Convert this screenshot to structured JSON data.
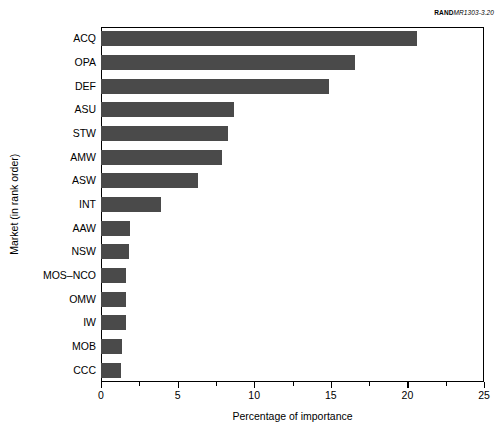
{
  "source_tag": {
    "brand": "RAND",
    "code": "MR1303-3.20"
  },
  "chart_data": {
    "type": "bar",
    "orientation": "horizontal",
    "title": "",
    "xlabel": "Percentage of importance",
    "ylabel": "Market (in rank order)",
    "categories": [
      "ACQ",
      "OPA",
      "DEF",
      "ASU",
      "STW",
      "AMW",
      "ASW",
      "INT",
      "AAW",
      "NSW",
      "MOS–NCO",
      "OMW",
      "IW",
      "MOB",
      "CCC"
    ],
    "values": [
      20.6,
      16.6,
      14.9,
      8.7,
      8.3,
      7.9,
      6.3,
      3.9,
      1.9,
      1.8,
      1.6,
      1.6,
      1.6,
      1.4,
      1.3
    ],
    "xlim": [
      0,
      25
    ],
    "xticks": [
      0,
      5,
      10,
      15,
      20,
      25
    ],
    "xticklabels": [
      "0",
      "5",
      "10",
      "15",
      "20",
      "25"
    ],
    "xminorticks": [
      2.5,
      7.5,
      12.5,
      17.5,
      22.5
    ],
    "grid": false,
    "legend": false,
    "bar_color": "#4a4a4a",
    "frame_color": "#000000",
    "background_color": "#ffffff"
  }
}
